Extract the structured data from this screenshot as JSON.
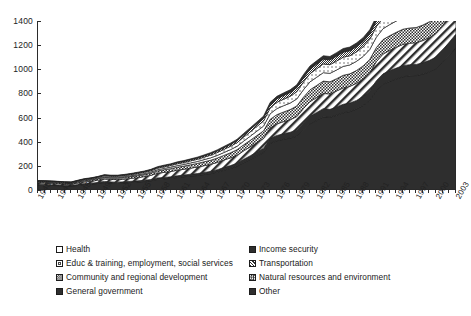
{
  "chart_data": {
    "type": "area",
    "title": "",
    "subtitle": "",
    "xlabel": "",
    "ylabel": "",
    "stacked": true,
    "grid": false,
    "legend_position": "bottom",
    "xlim": [
      1940,
      2003
    ],
    "ylim": [
      0,
      1400
    ],
    "yticks": [
      0,
      200,
      400,
      600,
      800,
      1000,
      1200,
      1400
    ],
    "xtick_labels": [
      "1940",
      "1943",
      "1946",
      "1949",
      "1952",
      "1955",
      "1958",
      "1961",
      "1964",
      "1967",
      "1970",
      "1973",
      "1976",
      "1979",
      "1982",
      "1985",
      "1988",
      "1991",
      "1994",
      "1997",
      "2000",
      "2003"
    ],
    "x": [
      1940,
      1941,
      1942,
      1943,
      1944,
      1945,
      1946,
      1947,
      1948,
      1949,
      1950,
      1951,
      1952,
      1953,
      1954,
      1955,
      1956,
      1957,
      1958,
      1959,
      1960,
      1961,
      1962,
      1963,
      1964,
      1965,
      1966,
      1967,
      1968,
      1969,
      1970,
      1971,
      1972,
      1973,
      1974,
      1975,
      1976,
      1977,
      1978,
      1979,
      1980,
      1981,
      1982,
      1983,
      1984,
      1985,
      1986,
      1987,
      1988,
      1989,
      1990,
      1991,
      1992,
      1993,
      1994,
      1995,
      1996,
      1997,
      1998,
      1999,
      2000,
      2001,
      2002,
      2003
    ],
    "series": [
      {
        "name": "Income security",
        "pattern": "solid-dark",
        "values": [
          42,
          40,
          38,
          36,
          34,
          33,
          38,
          45,
          48,
          55,
          62,
          58,
          56,
          58,
          62,
          66,
          70,
          76,
          88,
          92,
          96,
          104,
          110,
          116,
          120,
          128,
          136,
          148,
          164,
          178,
          196,
          226,
          254,
          282,
          310,
          386,
          408,
          420,
          430,
          446,
          498,
          548,
          576,
          606,
          602,
          620,
          640,
          650,
          670,
          700,
          740,
          824,
          876,
          900,
          920,
          938,
          946,
          948,
          960,
          978,
          1004,
          1058,
          1118,
          1178
        ]
      },
      {
        "name": "Other",
        "pattern": "solid-dark",
        "values": [
          6,
          6,
          6,
          6,
          6,
          6,
          7,
          8,
          8,
          8,
          9,
          9,
          9,
          10,
          10,
          10,
          11,
          11,
          12,
          12,
          13,
          14,
          14,
          15,
          16,
          17,
          18,
          20,
          22,
          24,
          26,
          28,
          30,
          33,
          36,
          40,
          44,
          46,
          48,
          52,
          58,
          62,
          66,
          68,
          66,
          68,
          70,
          70,
          72,
          74,
          78,
          82,
          86,
          88,
          90,
          92,
          92,
          92,
          94,
          96,
          98,
          102,
          108,
          114
        ]
      },
      {
        "name": "Transportation",
        "pattern": "diagonal-white",
        "values": [
          10,
          11,
          11,
          10,
          9,
          9,
          12,
          14,
          16,
          18,
          20,
          20,
          21,
          22,
          24,
          26,
          30,
          34,
          38,
          42,
          44,
          46,
          48,
          50,
          54,
          56,
          58,
          60,
          62,
          64,
          66,
          70,
          74,
          78,
          82,
          90,
          96,
          100,
          104,
          110,
          118,
          122,
          124,
          126,
          128,
          132,
          136,
          138,
          142,
          146,
          152,
          158,
          164,
          168,
          172,
          176,
          178,
          180,
          184,
          190,
          196,
          204,
          216,
          228
        ]
      },
      {
        "name": "Natural resources and environment",
        "pattern": "checker",
        "values": [
          8,
          8,
          8,
          8,
          7,
          7,
          9,
          10,
          11,
          12,
          13,
          13,
          14,
          14,
          15,
          16,
          17,
          18,
          20,
          22,
          24,
          25,
          26,
          28,
          30,
          32,
          34,
          36,
          38,
          42,
          46,
          50,
          54,
          58,
          62,
          70,
          76,
          80,
          84,
          88,
          94,
          98,
          100,
          102,
          100,
          102,
          104,
          104,
          106,
          108,
          112,
          116,
          120,
          122,
          124,
          126,
          126,
          126,
          128,
          130,
          132,
          138,
          146,
          154
        ]
      },
      {
        "name": "Health",
        "pattern": "white",
        "values": [
          3,
          3,
          3,
          3,
          3,
          3,
          4,
          4,
          5,
          5,
          6,
          6,
          6,
          7,
          7,
          8,
          8,
          9,
          10,
          11,
          12,
          13,
          14,
          15,
          16,
          18,
          20,
          22,
          24,
          26,
          28,
          31,
          34,
          37,
          40,
          46,
          50,
          52,
          54,
          58,
          62,
          66,
          68,
          70,
          70,
          72,
          74,
          74,
          76,
          78,
          82,
          86,
          90,
          92,
          94,
          96,
          96,
          96,
          98,
          100,
          102,
          106,
          112,
          118
        ]
      },
      {
        "name": "Educ & training, employment, social services",
        "pattern": "white-dot",
        "values": [
          4,
          4,
          4,
          4,
          4,
          4,
          5,
          6,
          6,
          7,
          8,
          8,
          8,
          9,
          9,
          10,
          10,
          11,
          12,
          13,
          14,
          15,
          16,
          17,
          18,
          20,
          22,
          24,
          26,
          28,
          30,
          33,
          36,
          39,
          42,
          48,
          52,
          54,
          56,
          60,
          64,
          68,
          70,
          72,
          72,
          74,
          76,
          76,
          78,
          80,
          84,
          88,
          92,
          94,
          96,
          98,
          98,
          98,
          100,
          102,
          104,
          108,
          114,
          120
        ]
      },
      {
        "name": "Community and regional development",
        "pattern": "checker-dense",
        "values": [
          3,
          3,
          3,
          3,
          3,
          3,
          3,
          4,
          4,
          4,
          5,
          5,
          5,
          5,
          6,
          6,
          6,
          7,
          7,
          8,
          8,
          9,
          9,
          10,
          10,
          11,
          12,
          13,
          14,
          15,
          16,
          18,
          20,
          22,
          24,
          28,
          30,
          31,
          32,
          34,
          36,
          38,
          39,
          40,
          40,
          41,
          42,
          42,
          43,
          44,
          46,
          48,
          50,
          51,
          52,
          53,
          53,
          53,
          54,
          55,
          56,
          58,
          61,
          64
        ]
      },
      {
        "name": "General government",
        "pattern": "solid-dark",
        "values": [
          2,
          2,
          2,
          2,
          2,
          2,
          3,
          3,
          3,
          3,
          4,
          4,
          4,
          4,
          4,
          5,
          5,
          5,
          6,
          6,
          6,
          7,
          7,
          7,
          8,
          8,
          9,
          9,
          10,
          11,
          12,
          13,
          14,
          15,
          16,
          18,
          20,
          21,
          22,
          23,
          25,
          26,
          27,
          28,
          28,
          29,
          30,
          30,
          31,
          32,
          33,
          35,
          36,
          37,
          38,
          39,
          39,
          39,
          40,
          41,
          42,
          44,
          46,
          48
        ]
      }
    ]
  },
  "legend": {
    "items": [
      {
        "label": "Health",
        "pattern": "white",
        "col": 0,
        "row": 0
      },
      {
        "label": "Income security",
        "pattern": "solid-dark",
        "col": 1,
        "row": 0
      },
      {
        "label": "Educ & training, employment, social services",
        "pattern": "white-dot",
        "col": 0,
        "row": 1
      },
      {
        "label": "Transportation",
        "pattern": "diagonal-white",
        "col": 1,
        "row": 1
      },
      {
        "label": "Community and regional development",
        "pattern": "checker-dense",
        "col": 0,
        "row": 2
      },
      {
        "label": "Natural resources and environment",
        "pattern": "checker",
        "col": 1,
        "row": 2
      },
      {
        "label": "General government",
        "pattern": "solid-dark",
        "col": 0,
        "row": 3
      },
      {
        "label": "Other",
        "pattern": "solid-dark",
        "col": 1,
        "row": 3
      }
    ]
  },
  "colors": {
    "axis": "#2b2b2b",
    "text": "#1a1a1a",
    "dark_fill": "#2e2e2e",
    "background": "#ffffff"
  }
}
